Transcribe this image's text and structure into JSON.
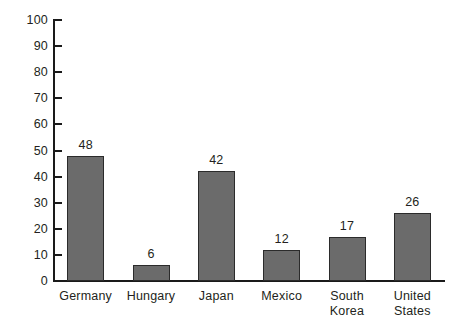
{
  "chart_data": {
    "type": "bar",
    "title": "",
    "subtitle": "",
    "xlabel": "",
    "ylabel": "",
    "categories": [
      "Germany",
      "Hungary",
      "Japan",
      "Mexico",
      "South\nKorea",
      "United\nStates"
    ],
    "values": [
      48,
      6,
      42,
      12,
      17,
      26
    ],
    "value_labels": [
      "48",
      "6",
      "42",
      "12",
      "17",
      "26"
    ],
    "ylim": [
      0,
      100
    ],
    "ytick_step": 10,
    "yticks": [
      0,
      10,
      20,
      30,
      40,
      50,
      60,
      70,
      80,
      90,
      100
    ],
    "ytick_labels": [
      "0",
      "10",
      "20",
      "30",
      "40",
      "50",
      "60",
      "70",
      "80",
      "90",
      "100"
    ],
    "grid": false,
    "legend": null,
    "legend_position": "none",
    "annotations": [],
    "colors": {
      "bar_fill": "#6b6b6b",
      "bar_edge": "#2b2b2b",
      "axis": "#1a1a1a",
      "text": "#231f20",
      "background": "#ffffff"
    }
  }
}
